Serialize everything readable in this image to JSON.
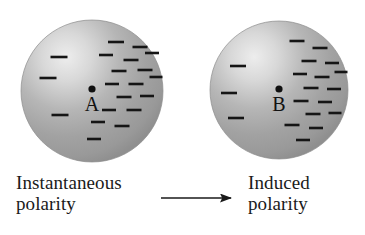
{
  "figure": {
    "name": "instantaneous-and-induced-polarity",
    "background_color": "#ffffff"
  },
  "spheres": [
    {
      "id": "sphere-a",
      "label": "A",
      "cx": 92,
      "cy": 91,
      "r": 71,
      "body_color": "#a8a8a8",
      "highlight_color": "#e8e8e8",
      "edge_color": "#8a8a8a",
      "center_dot_color": "#101010",
      "center_dot_r": 3.6,
      "charge_symbol": "minus",
      "charge_color": "#151515",
      "charges_left": [
        {
          "x": 59,
          "y": 57,
          "w": 17
        },
        {
          "x": 48,
          "y": 78,
          "w": 17
        },
        {
          "x": 60,
          "y": 115,
          "w": 17
        }
      ],
      "charges_right": [
        {
          "x": 116,
          "y": 42,
          "w": 16
        },
        {
          "x": 140,
          "y": 47,
          "w": 15
        },
        {
          "x": 106,
          "y": 55,
          "w": 14
        },
        {
          "x": 131,
          "y": 60,
          "w": 15
        },
        {
          "x": 152,
          "y": 53,
          "w": 14
        },
        {
          "x": 119,
          "y": 71,
          "w": 15
        },
        {
          "x": 145,
          "y": 70,
          "w": 15
        },
        {
          "x": 112,
          "y": 84,
          "w": 14
        },
        {
          "x": 136,
          "y": 84,
          "w": 15
        },
        {
          "x": 156,
          "y": 77,
          "w": 13
        },
        {
          "x": 124,
          "y": 97,
          "w": 15
        },
        {
          "x": 147,
          "y": 96,
          "w": 14
        },
        {
          "x": 109,
          "y": 110,
          "w": 14
        },
        {
          "x": 134,
          "y": 110,
          "w": 15
        },
        {
          "x": 98,
          "y": 122,
          "w": 14
        },
        {
          "x": 122,
          "y": 126,
          "w": 15
        },
        {
          "x": 94,
          "y": 139,
          "w": 14
        }
      ]
    },
    {
      "id": "sphere-b",
      "label": "B",
      "cx": 279,
      "cy": 90,
      "r": 69,
      "body_color": "#a8a8a8",
      "highlight_color": "#e8e8e8",
      "edge_color": "#8a8a8a",
      "center_dot_color": "#101010",
      "center_dot_r": 3.6,
      "charge_symbol": "minus",
      "charge_color": "#151515",
      "charges_left": [
        {
          "x": 238,
          "y": 66,
          "w": 16
        },
        {
          "x": 229,
          "y": 93,
          "w": 16
        },
        {
          "x": 236,
          "y": 118,
          "w": 16
        }
      ],
      "charges_right": [
        {
          "x": 297,
          "y": 41,
          "w": 15
        },
        {
          "x": 320,
          "y": 48,
          "w": 15
        },
        {
          "x": 309,
          "y": 61,
          "w": 15
        },
        {
          "x": 332,
          "y": 63,
          "w": 14
        },
        {
          "x": 300,
          "y": 74,
          "w": 14
        },
        {
          "x": 322,
          "y": 77,
          "w": 15
        },
        {
          "x": 341,
          "y": 72,
          "w": 13
        },
        {
          "x": 311,
          "y": 88,
          "w": 15
        },
        {
          "x": 334,
          "y": 89,
          "w": 14
        },
        {
          "x": 301,
          "y": 101,
          "w": 15
        },
        {
          "x": 325,
          "y": 102,
          "w": 14
        },
        {
          "x": 313,
          "y": 114,
          "w": 15
        },
        {
          "x": 335,
          "y": 113,
          "w": 13
        },
        {
          "x": 292,
          "y": 125,
          "w": 15
        },
        {
          "x": 316,
          "y": 128,
          "w": 14
        },
        {
          "x": 303,
          "y": 140,
          "w": 14
        }
      ]
    }
  ],
  "arrow": {
    "label": "process-arrow",
    "x1": 161,
    "x2": 238,
    "y": 198,
    "color": "#1a1a1a",
    "stroke_width": 1.6,
    "head_length": 13,
    "head_width": 9
  },
  "captions": {
    "left": {
      "line1": "Instantaneous",
      "line2": "polarity"
    },
    "right": {
      "line1": "Induced",
      "line2": "polarity"
    }
  }
}
